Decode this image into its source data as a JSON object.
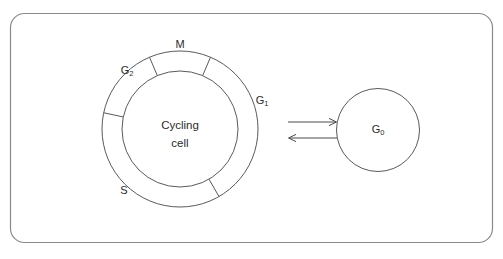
{
  "diagram": {
    "frame": {
      "name": "diagram-border"
    },
    "center_label": {
      "line1": "Cycling",
      "line2": "cell"
    },
    "phases": [
      {
        "id": "M",
        "label": "M",
        "sub": "",
        "x": 180,
        "y": 45
      },
      {
        "id": "G2",
        "label": "G",
        "sub": "2",
        "x": 127,
        "y": 71
      },
      {
        "id": "S",
        "label": "S",
        "sub": "",
        "x": 124,
        "y": 191
      },
      {
        "id": "G1",
        "label": "G",
        "sub": "1",
        "x": 262,
        "y": 101
      }
    ],
    "quiescent": {
      "id": "G0",
      "label": "G",
      "sub": "0",
      "x": 378,
      "y": 130
    },
    "arrows": [
      {
        "id": "enter-g0",
        "direction": "right",
        "from_x": 288,
        "to_x": 337,
        "y": 122
      },
      {
        "id": "exit-g0",
        "direction": "left",
        "from_x": 337,
        "to_x": 288,
        "y": 138
      }
    ],
    "colors": {
      "stroke": "#5a5a5a",
      "frame_stroke": "#8a8a8a",
      "text": "#2b2b2b",
      "arrow": "#4a4a4a",
      "background": "#ffffff"
    }
  }
}
